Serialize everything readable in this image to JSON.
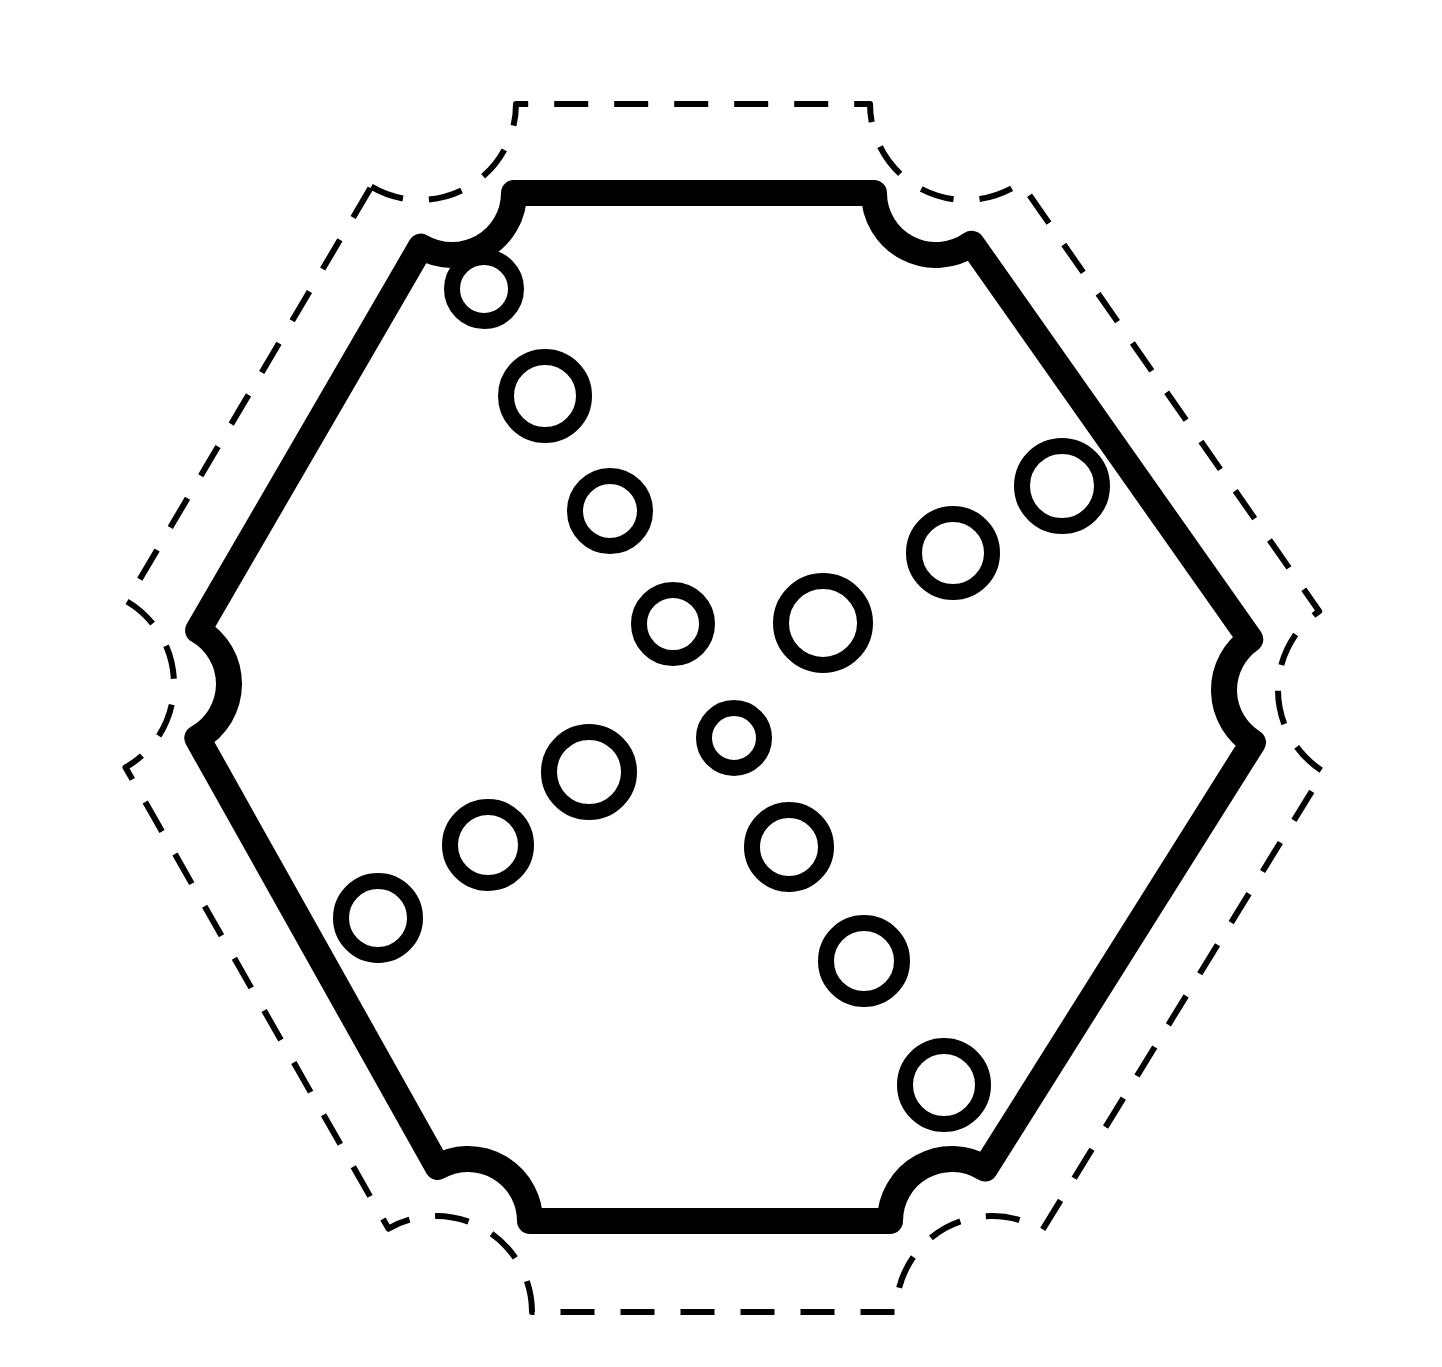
{
  "canvas": {
    "width": 1442,
    "height": 1367,
    "background": "#ffffff",
    "title": "Rounded hexagon outline with dashed offset border and ring markers"
  },
  "style": {
    "ink": "#000000",
    "hex_stroke_width": 26,
    "dash_stroke_width": 6,
    "dash_pattern": "34 26",
    "ring_stroke_width": 16
  },
  "shapes": {
    "hexagon": {
      "name": "rounded-hexagon",
      "corner_radius": 62,
      "vertices": [
        [
          452,
          193
        ],
        [
          936,
          193
        ],
        [
          1286,
          690
        ],
        [
          952,
          1221
        ],
        [
          468,
          1221
        ],
        [
          167,
          684
        ]
      ]
    },
    "dashed_outline": {
      "name": "dashed-offset-outline",
      "corner_radius": 96,
      "offset": 82,
      "vertices": [
        [
          420,
          104
        ],
        [
          966,
          104
        ],
        [
          1374,
          690
        ],
        [
          992,
          1312
        ],
        [
          436,
          1312
        ],
        [
          78,
          684
        ]
      ]
    },
    "rings": [
      {
        "id": "ring-1",
        "cx": 484,
        "cy": 289,
        "r": 40
      },
      {
        "id": "ring-2",
        "cx": 545,
        "cy": 396,
        "r": 47
      },
      {
        "id": "ring-3",
        "cx": 610,
        "cy": 511,
        "r": 43
      },
      {
        "id": "ring-4",
        "cx": 673,
        "cy": 624,
        "r": 42
      },
      {
        "id": "ring-5",
        "cx": 823,
        "cy": 623,
        "r": 50
      },
      {
        "id": "ring-6",
        "cx": 953,
        "cy": 553,
        "r": 47
      },
      {
        "id": "ring-7",
        "cx": 1062,
        "cy": 486,
        "r": 48
      },
      {
        "id": "ring-8",
        "cx": 734,
        "cy": 738,
        "r": 38
      },
      {
        "id": "ring-9",
        "cx": 589,
        "cy": 772,
        "r": 48
      },
      {
        "id": "ring-10",
        "cx": 488,
        "cy": 845,
        "r": 46
      },
      {
        "id": "ring-11",
        "cx": 378,
        "cy": 918,
        "r": 45
      },
      {
        "id": "ring-12",
        "cx": 789,
        "cy": 847,
        "r": 45
      },
      {
        "id": "ring-13",
        "cx": 864,
        "cy": 961,
        "r": 46
      },
      {
        "id": "ring-14",
        "cx": 944,
        "cy": 1085,
        "r": 47
      }
    ]
  },
  "chart_data": {
    "type": "scatter",
    "xlabel": "",
    "ylabel": "",
    "xlim": [
      0,
      1442
    ],
    "ylim": [
      0,
      1367
    ],
    "grid": false,
    "legend": "none",
    "series": [
      {
        "name": "rings",
        "marker": "open-circle",
        "color": "#000000",
        "points": [
          {
            "x": 484,
            "y": 289,
            "r": 40
          },
          {
            "x": 545,
            "y": 396,
            "r": 47
          },
          {
            "x": 610,
            "y": 511,
            "r": 43
          },
          {
            "x": 673,
            "y": 624,
            "r": 42
          },
          {
            "x": 823,
            "y": 623,
            "r": 50
          },
          {
            "x": 953,
            "y": 553,
            "r": 47
          },
          {
            "x": 1062,
            "y": 486,
            "r": 48
          },
          {
            "x": 734,
            "y": 738,
            "r": 38
          },
          {
            "x": 589,
            "y": 772,
            "r": 48
          },
          {
            "x": 488,
            "y": 845,
            "r": 46
          },
          {
            "x": 378,
            "y": 918,
            "r": 45
          },
          {
            "x": 789,
            "y": 847,
            "r": 45
          },
          {
            "x": 864,
            "y": 961,
            "r": 46
          },
          {
            "x": 944,
            "y": 1085,
            "r": 47
          }
        ]
      }
    ],
    "annotations": [
      {
        "name": "rounded-hexagon-boundary",
        "style": "solid",
        "stroke_width": 26
      },
      {
        "name": "dashed-offset-boundary",
        "style": "dashed",
        "stroke_width": 6
      }
    ]
  }
}
